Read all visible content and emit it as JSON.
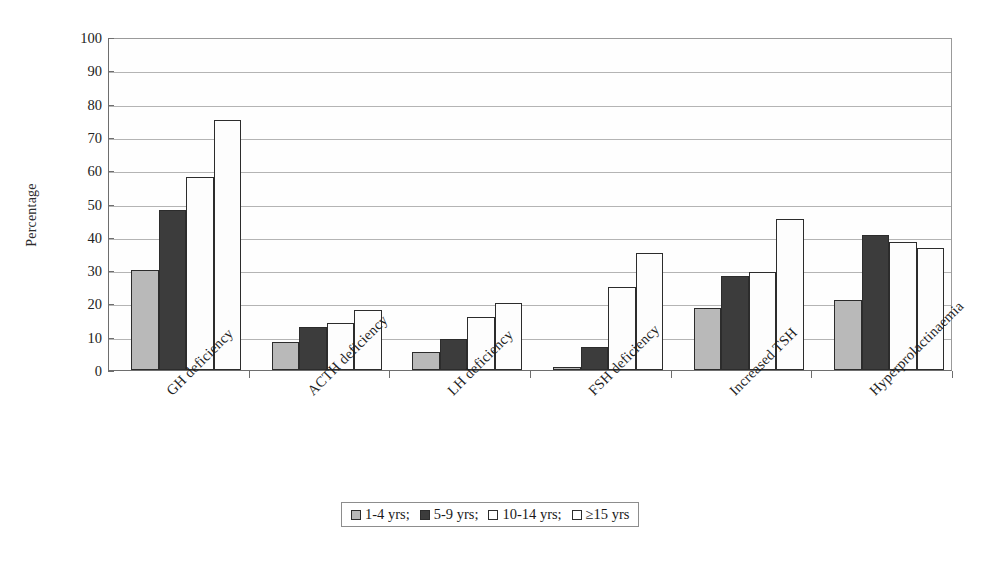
{
  "chart_data": {
    "type": "bar",
    "title": "",
    "xlabel": "",
    "ylabel": "Percentage",
    "ylim": [
      0,
      100
    ],
    "ytick_step": 10,
    "yticks": [
      0,
      10,
      20,
      30,
      40,
      50,
      60,
      70,
      80,
      90,
      100
    ],
    "grid": true,
    "legend_position": "bottom-center",
    "categories": [
      "GH deficiency",
      "ACTH deficiency",
      "LH deficiency",
      "FSH deficiency",
      "Increased TSH",
      "Hyperprolactinaemia"
    ],
    "series": [
      {
        "name": "1-4 yrs;",
        "color": "#b9b9b9",
        "values": [
          30.0,
          8.5,
          5.3,
          0.8,
          18.5,
          21.0
        ]
      },
      {
        "name": "5-9 yrs;",
        "color": "#3c3c3c",
        "values": [
          48.0,
          13.0,
          9.3,
          7.0,
          28.3,
          40.5
        ]
      },
      {
        "name": "10-14 yrs;",
        "color": "#fdfdfd",
        "values": [
          58.0,
          14.0,
          16.0,
          25.0,
          29.5,
          38.5
        ]
      },
      {
        "name": "≥15 yrs",
        "color": "#fdfdfd",
        "values": [
          75.0,
          18.0,
          20.2,
          35.0,
          45.5,
          36.5
        ]
      }
    ]
  }
}
